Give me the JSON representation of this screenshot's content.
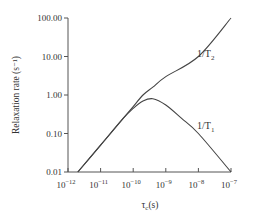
{
  "chart_data": {
    "type": "line",
    "title": "",
    "xlabel": "τc(s)",
    "ylabel": "Relaxation rate (s⁻¹)",
    "xscale": "log",
    "yscale": "log",
    "xlim": [
      1e-12,
      1e-07
    ],
    "ylim": [
      0.01,
      100
    ],
    "x_tick_labels": [
      {
        "base": "10",
        "exp": "−12"
      },
      {
        "base": "10",
        "exp": "−11"
      },
      {
        "base": "10",
        "exp": "−10"
      },
      {
        "base": "10",
        "exp": "−9"
      },
      {
        "base": "10",
        "exp": "−8"
      },
      {
        "base": "10",
        "exp": "−7"
      }
    ],
    "y_tick_labels": [
      "100.00",
      "10.00",
      "1.00",
      "0.10",
      "0.01"
    ],
    "grid": false,
    "legend": "inline labels",
    "series": [
      {
        "name": "1/T2",
        "label_main": "1/T",
        "label_sub": "2",
        "x": [
          2e-12,
          1e-11,
          5e-11,
          1e-10,
          2e-10,
          4e-10,
          1e-09,
          1e-08,
          1e-07
        ],
        "values": [
          0.01,
          0.05,
          0.25,
          0.5,
          1.0,
          1.6,
          3.0,
          10.0,
          100.0
        ]
      },
      {
        "name": "1/T1",
        "label_main": "1/T",
        "label_sub": "1",
        "x": [
          2e-12,
          1e-11,
          5e-11,
          1e-10,
          2e-10,
          4e-10,
          1e-09,
          3e-09,
          1e-08,
          1e-07
        ],
        "values": [
          0.01,
          0.05,
          0.25,
          0.45,
          0.7,
          0.8,
          0.55,
          0.25,
          0.1,
          0.01
        ]
      }
    ]
  }
}
